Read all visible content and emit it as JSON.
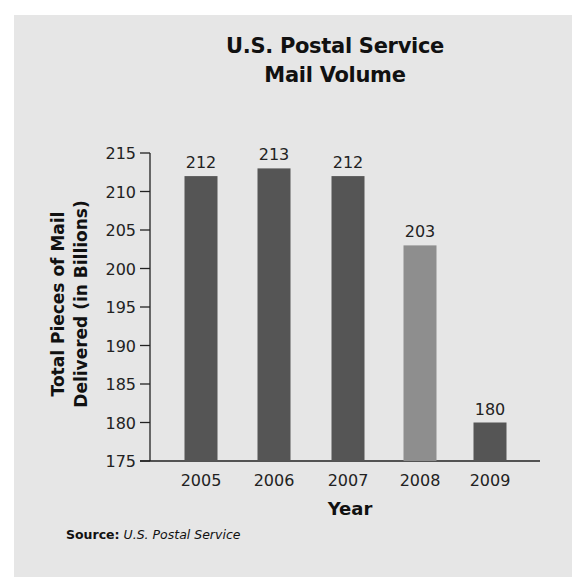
{
  "chart_data": {
    "type": "bar",
    "title": "U.S. Postal Service Mail Volume",
    "title_lines": [
      "U.S. Postal Service",
      "Mail Volume"
    ],
    "xlabel": "Year",
    "ylabel": "Total Pieces of Mail Delivered (in Billions)",
    "ylabel_lines": [
      "Total Pieces of Mail",
      "Delivered (in Billions)"
    ],
    "categories": [
      "2005",
      "2006",
      "2007",
      "2008",
      "2009"
    ],
    "values": [
      212,
      213,
      212,
      203,
      180
    ],
    "value_labels": [
      "212",
      "213",
      "212",
      "203",
      "180"
    ],
    "bar_colors": [
      "#555555",
      "#555555",
      "#555555",
      "#8e8e8e",
      "#555555"
    ],
    "ylim": [
      175,
      215
    ],
    "yticks": [
      175,
      180,
      185,
      190,
      195,
      200,
      205,
      210,
      215
    ],
    "grid": false,
    "legend": null,
    "source_label": "Source:",
    "source_text": "U.S. Postal Service"
  },
  "colors": {
    "panel_background": "#e6e6e6",
    "bar_dark": "#555555",
    "bar_highlight": "#8e8e8e",
    "axis": "#222222"
  }
}
